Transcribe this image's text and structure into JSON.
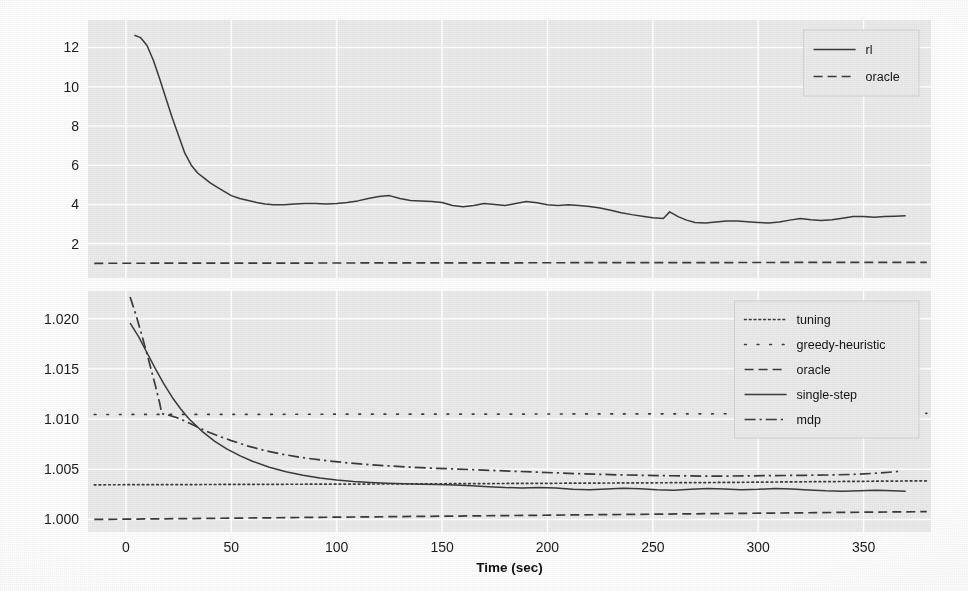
{
  "figure": {
    "background_color": "#fdfdfd",
    "panel_background_color": "#ebebeb",
    "grid_color": "#ffffff",
    "line_color": "#3a3a3a"
  },
  "chart_data": [
    {
      "type": "line",
      "panel": "top",
      "title": "",
      "xlabel": "",
      "ylabel": "",
      "xlim": [
        -18,
        382
      ],
      "ylim": [
        0.25,
        13.4
      ],
      "xticks": [
        0,
        50,
        100,
        150,
        200,
        250,
        300,
        350
      ],
      "xticklabels": [
        "0",
        "50",
        "100",
        "150",
        "200",
        "250",
        "300",
        "350"
      ],
      "yticks": [
        2,
        4,
        6,
        8,
        10,
        12
      ],
      "yticklabels": [
        "2",
        "4",
        "6",
        "8",
        "10",
        "12"
      ],
      "grid": true,
      "legend_position": "top-right",
      "series": [
        {
          "name": "rl",
          "style": "solid",
          "x": [
            4,
            7,
            10,
            13,
            16,
            19,
            22,
            25,
            28,
            31,
            34,
            37,
            40,
            43,
            46,
            50,
            54,
            58,
            62,
            66,
            70,
            75,
            80,
            85,
            90,
            95,
            100,
            105,
            110,
            115,
            120,
            125,
            130,
            135,
            140,
            145,
            150,
            155,
            160,
            165,
            170,
            175,
            180,
            185,
            190,
            195,
            200,
            205,
            210,
            215,
            220,
            225,
            230,
            235,
            240,
            245,
            250,
            255,
            258,
            262,
            266,
            270,
            275,
            280,
            285,
            290,
            295,
            300,
            305,
            310,
            315,
            320,
            325,
            330,
            335,
            340,
            345,
            350,
            355,
            360,
            365,
            370
          ],
          "y": [
            12.62,
            12.5,
            12.1,
            11.35,
            10.4,
            9.4,
            8.4,
            7.5,
            6.6,
            6.0,
            5.6,
            5.35,
            5.1,
            4.9,
            4.7,
            4.45,
            4.3,
            4.2,
            4.1,
            4.02,
            3.98,
            3.98,
            4.02,
            4.05,
            4.05,
            4.02,
            4.05,
            4.1,
            4.18,
            4.3,
            4.4,
            4.45,
            4.3,
            4.2,
            4.18,
            4.15,
            4.1,
            3.95,
            3.88,
            3.95,
            4.05,
            4.0,
            3.95,
            4.05,
            4.15,
            4.08,
            3.98,
            3.95,
            3.98,
            3.95,
            3.9,
            3.82,
            3.7,
            3.58,
            3.48,
            3.4,
            3.32,
            3.28,
            3.62,
            3.38,
            3.2,
            3.08,
            3.05,
            3.1,
            3.15,
            3.15,
            3.12,
            3.08,
            3.05,
            3.1,
            3.2,
            3.28,
            3.22,
            3.18,
            3.22,
            3.3,
            3.38,
            3.38,
            3.35,
            3.38,
            3.4,
            3.42
          ]
        },
        {
          "name": "oracle",
          "style": "dashed",
          "x": [
            -15,
            380
          ],
          "y": [
            1.0,
            1.05
          ]
        }
      ],
      "legend": [
        {
          "label": "rl",
          "style": "solid"
        },
        {
          "label": "oracle",
          "style": "dashed"
        }
      ]
    },
    {
      "type": "line",
      "panel": "bottom",
      "title": "",
      "xlabel": "Time (sec)",
      "ylabel": "",
      "xlim": [
        -18,
        382
      ],
      "ylim": [
        0.99875,
        1.02275
      ],
      "xticks": [
        0,
        50,
        100,
        150,
        200,
        250,
        300,
        350
      ],
      "xticklabels": [
        "0",
        "50",
        "100",
        "150",
        "200",
        "250",
        "300",
        "350"
      ],
      "yticks": [
        1.0,
        1.005,
        1.01,
        1.015,
        1.02
      ],
      "yticklabels": [
        "1.000",
        "1.005",
        "1.010",
        "1.015",
        "1.020"
      ],
      "grid": true,
      "legend_position": "top-right",
      "series": [
        {
          "name": "tuning",
          "style": "dotted",
          "x": [
            -15,
            40,
            120,
            200,
            280,
            380
          ],
          "y": [
            1.00345,
            1.00348,
            1.00353,
            1.0036,
            1.00368,
            1.00385
          ]
        },
        {
          "name": "greedy-heuristic",
          "style": "sparse-dotted",
          "x": [
            -15,
            100,
            200,
            300,
            380
          ],
          "y": [
            1.01045,
            1.01048,
            1.0105,
            1.01053,
            1.01057
          ]
        },
        {
          "name": "oracle",
          "style": "dashed",
          "x": [
            -15,
            380
          ],
          "y": [
            1.0,
            1.00078
          ]
        },
        {
          "name": "single-step",
          "style": "solid",
          "x": [
            2,
            6,
            10,
            14,
            18,
            22,
            26,
            30,
            36,
            42,
            48,
            54,
            60,
            68,
            76,
            84,
            92,
            100,
            108,
            116,
            124,
            132,
            140,
            148,
            156,
            164,
            172,
            180,
            188,
            196,
            204,
            212,
            220,
            228,
            236,
            244,
            252,
            260,
            268,
            276,
            284,
            292,
            300,
            308,
            316,
            324,
            332,
            340,
            348,
            356,
            364,
            370
          ],
          "y": [
            1.01955,
            1.0182,
            1.0166,
            1.015,
            1.0135,
            1.01215,
            1.011,
            1.01,
            1.0088,
            1.0078,
            1.007,
            1.00635,
            1.0058,
            1.0052,
            1.00475,
            1.0044,
            1.00413,
            1.00392,
            1.00378,
            1.00368,
            1.0036,
            1.00355,
            1.00351,
            1.00348,
            1.00342,
            1.00335,
            1.00326,
            1.00318,
            1.00314,
            1.00318,
            1.00312,
            1.003,
            1.00296,
            1.00302,
            1.0031,
            1.00306,
            1.00296,
            1.00292,
            1.003,
            1.00308,
            1.00304,
            1.00296,
            1.003,
            1.00308,
            1.00304,
            1.00294,
            1.00286,
            1.00282,
            1.00286,
            1.0029,
            1.00286,
            1.00282
          ]
        },
        {
          "name": "mdp",
          "style": "dashdot",
          "x": [
            2,
            5,
            8,
            11,
            14,
            16,
            17,
            20,
            24,
            28,
            32,
            38,
            44,
            50,
            58,
            66,
            74,
            84,
            94,
            104,
            114,
            124,
            134,
            144,
            154,
            164,
            174,
            184,
            194,
            204,
            214,
            224,
            234,
            244,
            254,
            264,
            274,
            284,
            294,
            304,
            314,
            324,
            334,
            344,
            354,
            362,
            368
          ],
          "y": [
            1.02215,
            1.0202,
            1.018,
            1.0157,
            1.0133,
            1.0116,
            1.01055,
            1.0104,
            1.01015,
            1.0098,
            1.0094,
            1.0088,
            1.0083,
            1.00785,
            1.0073,
            1.00685,
            1.0065,
            1.00615,
            1.00588,
            1.00566,
            1.00548,
            1.00534,
            1.00522,
            1.00512,
            1.00504,
            1.00496,
            1.00488,
            1.0048,
            1.00472,
            1.00464,
            1.00456,
            1.0045,
            1.00444,
            1.0044,
            1.00436,
            1.00434,
            1.00432,
            1.00432,
            1.00434,
            1.00436,
            1.00438,
            1.0044,
            1.00443,
            1.00448,
            1.00458,
            1.0047,
            1.0048
          ]
        }
      ],
      "legend": [
        {
          "label": "tuning",
          "style": "dotted"
        },
        {
          "label": "greedy-heuristic",
          "style": "sparse-dotted"
        },
        {
          "label": "oracle",
          "style": "dashed"
        },
        {
          "label": "single-step",
          "style": "solid"
        },
        {
          "label": "mdp",
          "style": "dashdot"
        }
      ]
    }
  ]
}
